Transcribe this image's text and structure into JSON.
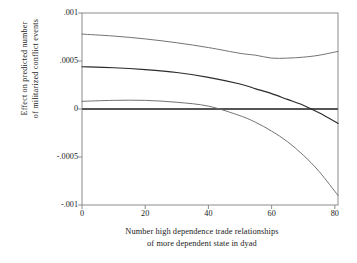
{
  "chart_data": {
    "type": "line",
    "title": "",
    "xlabel_lines": [
      "Number high dependence trade relationships",
      "of more dependent state in dyad"
    ],
    "ylabel_lines": [
      "Effect on predicted number",
      "of militarized conflict events"
    ],
    "xlim": [
      0,
      81
    ],
    "ylim": [
      -0.001,
      0.001
    ],
    "grid": false,
    "legend": "none",
    "xticks": [
      0,
      20,
      40,
      60,
      80
    ],
    "xtick_labels": [
      "0",
      "20",
      "40",
      "60",
      "80"
    ],
    "yticks": [
      0.001,
      0.0005,
      0,
      -0.0005,
      -0.001
    ],
    "ytick_labels": [
      ".001",
      ".0005",
      "0",
      "-.0005",
      "-.001"
    ],
    "reference_line": {
      "y": 0,
      "style": "thick-solid",
      "color": "#555555"
    },
    "x": [
      0,
      10,
      20,
      30,
      40,
      50,
      55,
      60,
      65,
      70,
      75,
      81
    ],
    "series": [
      {
        "name": "upper confidence bound",
        "color": "#6b6b6b",
        "values": [
          0.00078,
          0.00076,
          0.00073,
          0.00069,
          0.00064,
          0.00058,
          0.00056,
          0.00053,
          0.00053,
          0.00054,
          0.00056,
          0.0006
        ]
      },
      {
        "name": "point estimate",
        "color": "#2b2b2b",
        "values": [
          0.00044,
          0.00043,
          0.00041,
          0.00038,
          0.00033,
          0.00026,
          0.00021,
          0.00016,
          0.0001,
          4e-05,
          -4e-05,
          -0.00015
        ]
      },
      {
        "name": "lower confidence bound",
        "color": "#6b6b6b",
        "values": [
          8e-05,
          9e-05,
          9e-05,
          7e-05,
          3e-05,
          -7e-05,
          -0.00014,
          -0.00023,
          -0.00034,
          -0.00048,
          -0.00065,
          -0.0009
        ]
      }
    ],
    "annotations": [
      {
        "text": "lower bound crosses zero",
        "x": 46,
        "y": 0
      },
      {
        "text": "point estimate crosses zero",
        "x": 73,
        "y": 0
      }
    ]
  },
  "frame": {
    "color": "#8c8c8c"
  }
}
